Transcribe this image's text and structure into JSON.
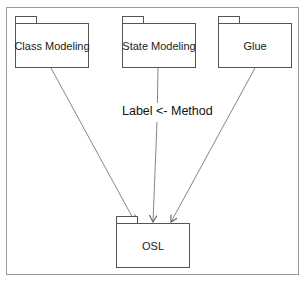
{
  "diagram": {
    "type": "UML package diagram",
    "packages": [
      {
        "id": "class_modeling",
        "name": "Class Modeling"
      },
      {
        "id": "state_modeling",
        "name": "State Modeling"
      },
      {
        "id": "glue",
        "name": "Glue"
      },
      {
        "id": "osl",
        "name": "OSL"
      }
    ],
    "edges": [
      {
        "from": "Class Modeling",
        "to": "OSL",
        "style": "dependency-arrow"
      },
      {
        "from": "State Modeling",
        "to": "OSL",
        "style": "dependency-arrow",
        "label": "Label <- Method"
      },
      {
        "from": "Glue",
        "to": "OSL",
        "style": "dependency-arrow"
      }
    ],
    "edge_label": "Label <- Method",
    "colors": {
      "line": "#555555",
      "frame": "#9a9a9a",
      "text": "#222222",
      "background": "#ffffff"
    }
  }
}
